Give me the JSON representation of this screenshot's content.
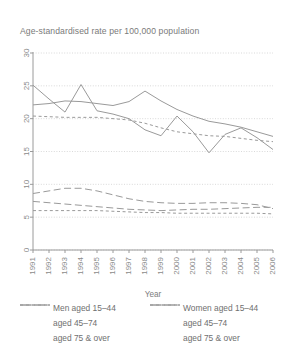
{
  "chart_data": {
    "type": "line",
    "title": "Age-standardised rate per 100,000 population",
    "xlabel": "Year",
    "ylabel": "",
    "x": [
      1991,
      1992,
      1993,
      1994,
      1995,
      1996,
      1997,
      1998,
      1999,
      2000,
      2001,
      2002,
      2003,
      2004,
      2005,
      2006
    ],
    "xticklabels": [
      "1991",
      "1992",
      "1993",
      "1994",
      "1995",
      "1996",
      "1997",
      "1998",
      "1999",
      "2000",
      "2001",
      "2002",
      "2003",
      "2004",
      "2005",
      "2006"
    ],
    "yticklabels": [
      "0",
      "5",
      "10",
      "15",
      "20",
      "25",
      "30"
    ],
    "yticks": [
      0,
      5,
      10,
      15,
      20,
      25,
      30
    ],
    "ylim": [
      0,
      30
    ],
    "grid": true,
    "legend_position": "below",
    "series": [
      {
        "name": "Men aged 15-44",
        "style": "dotted",
        "values": [
          20.4,
          20.3,
          20.2,
          20.2,
          20.2,
          20.0,
          19.8,
          19.3,
          18.6,
          18.0,
          17.7,
          17.4,
          17.3,
          17.0,
          16.7,
          16.5
        ]
      },
      {
        "name": "Men aged 45-74",
        "style": "dashed",
        "values": [
          8.6,
          9.0,
          9.4,
          9.4,
          9.0,
          8.4,
          7.8,
          7.4,
          7.2,
          7.1,
          7.1,
          7.2,
          7.2,
          7.1,
          6.9,
          6.3
        ]
      },
      {
        "name": "Men aged 75 & over",
        "style": "solid",
        "values": [
          25.1,
          23.0,
          21.0,
          25.2,
          21.2,
          20.7,
          20.0,
          18.3,
          17.4,
          20.4,
          18.0,
          14.8,
          17.6,
          18.6,
          17.1,
          15.3
        ]
      },
      {
        "name": "Women aged 15-44",
        "style": "dotted",
        "values": [
          6.0,
          6.0,
          6.0,
          6.0,
          6.0,
          5.9,
          5.8,
          5.7,
          5.7,
          5.6,
          5.6,
          5.6,
          5.6,
          5.6,
          5.6,
          5.5
        ]
      },
      {
        "name": "Women aged 45-74",
        "style": "dashed",
        "values": [
          7.4,
          7.2,
          7.0,
          6.8,
          6.6,
          6.4,
          6.2,
          6.1,
          6.0,
          6.1,
          6.2,
          6.2,
          6.3,
          6.4,
          6.5,
          6.5
        ]
      },
      {
        "name": "Women aged 75 & over",
        "style": "solid",
        "values": [
          22.1,
          22.3,
          22.7,
          22.6,
          22.3,
          22.0,
          22.6,
          24.2,
          22.7,
          21.4,
          20.4,
          19.6,
          19.2,
          18.7,
          18.0,
          17.3
        ]
      }
    ]
  },
  "legend": {
    "left": [
      {
        "label": "Men aged 15–44",
        "style": "dotted"
      },
      {
        "label": "aged 45–74",
        "style": "dashed"
      },
      {
        "label": "aged 75 & over",
        "style": "solid"
      }
    ],
    "right": [
      {
        "label": "Women aged 15–44",
        "style": "dotted"
      },
      {
        "label": "aged 45–74",
        "style": "dashed"
      },
      {
        "label": "aged 75 & over",
        "style": "solid"
      }
    ]
  },
  "colors": {
    "line": "#9a9a9a",
    "grid": "#cfcfcf",
    "axis": "#9a9a9a",
    "text": "#6f6f6f",
    "background": "#ffffff"
  }
}
